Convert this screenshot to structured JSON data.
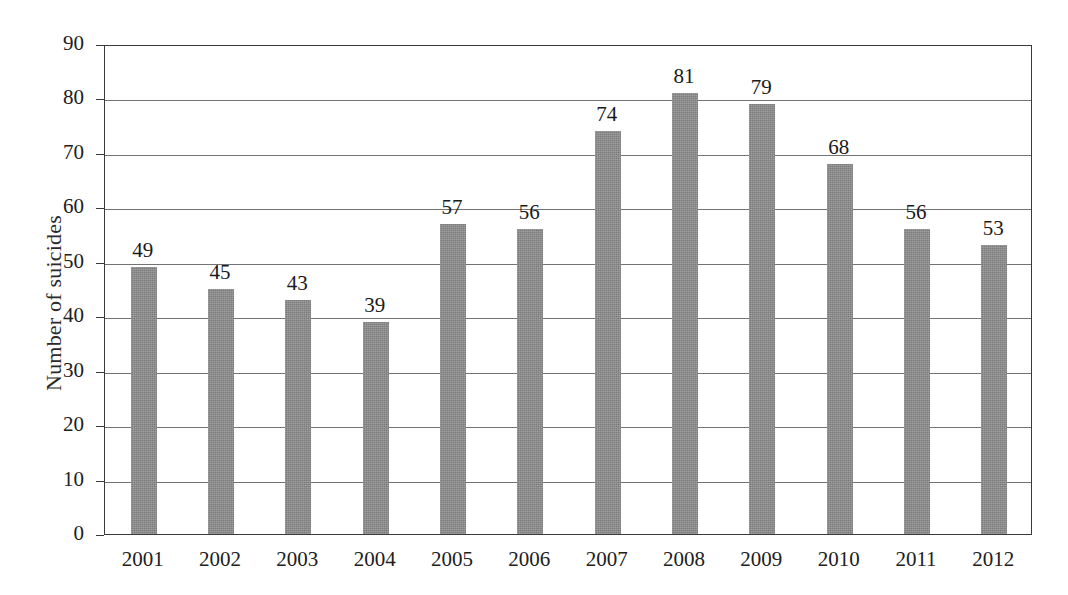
{
  "chart_data": {
    "type": "bar",
    "title": "",
    "xlabel": "",
    "ylabel": "Number of suicides",
    "categories": [
      "2001",
      "2002",
      "2003",
      "2004",
      "2005",
      "2006",
      "2007",
      "2008",
      "2009",
      "2010",
      "2011",
      "2012"
    ],
    "values": [
      49,
      45,
      43,
      39,
      57,
      56,
      74,
      81,
      79,
      68,
      56,
      53
    ],
    "data_labels": [
      "49",
      "45",
      "43",
      "39",
      "57",
      "56",
      "74",
      "81",
      "79",
      "68",
      "56",
      "53"
    ],
    "ylim": [
      0,
      90
    ],
    "ytick_values": [
      0,
      10,
      20,
      30,
      40,
      50,
      60,
      70,
      80,
      90
    ],
    "ytick_labels": [
      "0",
      "10",
      "20",
      "30",
      "40",
      "50",
      "60",
      "70",
      "80",
      "90"
    ],
    "grid": true,
    "grid_axis": "y",
    "legend": false,
    "legend_position": "none",
    "bar_color": "#8c8c8c",
    "axis_color": "#3a3a3a",
    "gridline_color": "#5a5a5a",
    "background_color": "#ffffff",
    "text_color": "#1a1a1a"
  }
}
